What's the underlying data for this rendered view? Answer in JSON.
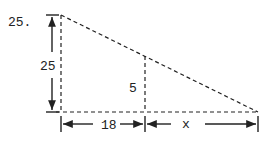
{
  "problem": {
    "number": "25.",
    "labels": {
      "height_left": "25",
      "height_inner": "5",
      "base_left": "18",
      "base_right": "x"
    }
  },
  "colors": {
    "stroke": "#222222",
    "background": "#ffffff"
  }
}
